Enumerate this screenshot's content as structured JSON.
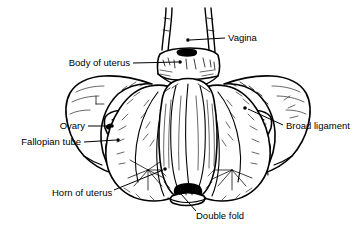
{
  "figure": {
    "type": "anatomical-line-drawing",
    "width": 362,
    "height": 235,
    "background_color": "#ffffff",
    "line_color": "#000000"
  },
  "labels": [
    {
      "id": "vagina",
      "text": "Vagina",
      "text_x": 228,
      "text_y": 38,
      "anchor": "start",
      "leader": "M225,38 L190,40",
      "dot_x": 188,
      "dot_y": 40
    },
    {
      "id": "body-of-uterus",
      "text": "Body of uterus",
      "text_x": 130,
      "text_y": 63,
      "anchor": "end",
      "leader": "M133,63 L178,62",
      "dot_x": 180,
      "dot_y": 62
    },
    {
      "id": "ovary",
      "text": "Ovary",
      "text_x": 85,
      "text_y": 126,
      "anchor": "end",
      "leader": "M88,126 L110,126",
      "dot_x": 112,
      "dot_y": 126
    },
    {
      "id": "fallopian-tube",
      "text": "Fallopian tube",
      "text_x": 81,
      "text_y": 142,
      "anchor": "end",
      "leader": "M84,142 L116,140",
      "dot_x": 118,
      "dot_y": 140
    },
    {
      "id": "broad-ligament",
      "text": "Broad ligament",
      "text_x": 286,
      "text_y": 126,
      "anchor": "start",
      "leader": "M283,125 L248,109",
      "dot_x": 245,
      "dot_y": 108
    },
    {
      "id": "horn-of-uterus",
      "text": "Horn of uterus",
      "text_x": 52,
      "text_y": 193,
      "anchor": "start",
      "leader": "M114,190 L163,170",
      "dot_x": 165,
      "dot_y": 169
    },
    {
      "id": "double-fold",
      "text": "Double fold",
      "text_x": 196,
      "text_y": 216,
      "anchor": "start",
      "leader": "M196,211 L181,194",
      "dot_x": 180,
      "dot_y": 193
    }
  ],
  "structures": [
    {
      "id": "vagina-tubes",
      "name": "Vagina"
    },
    {
      "id": "cervix-block",
      "name": "Cervix"
    },
    {
      "id": "uterus-body",
      "name": "Body of uterus"
    },
    {
      "id": "broad-ligament-left",
      "name": "Broad ligament (left)"
    },
    {
      "id": "broad-ligament-right",
      "name": "Broad ligament (right)"
    },
    {
      "id": "ovary-left",
      "name": "Ovary (left)"
    },
    {
      "id": "ovary-right",
      "name": "Ovary (right)"
    },
    {
      "id": "fallopian-tube-left",
      "name": "Fallopian tube (left)"
    },
    {
      "id": "fallopian-tube-right",
      "name": "Fallopian tube (right)"
    },
    {
      "id": "uterine-horn-left",
      "name": "Horn of uterus (left)"
    },
    {
      "id": "uterine-horn-right",
      "name": "Horn of uterus (right)"
    },
    {
      "id": "double-fold",
      "name": "Double fold"
    }
  ]
}
